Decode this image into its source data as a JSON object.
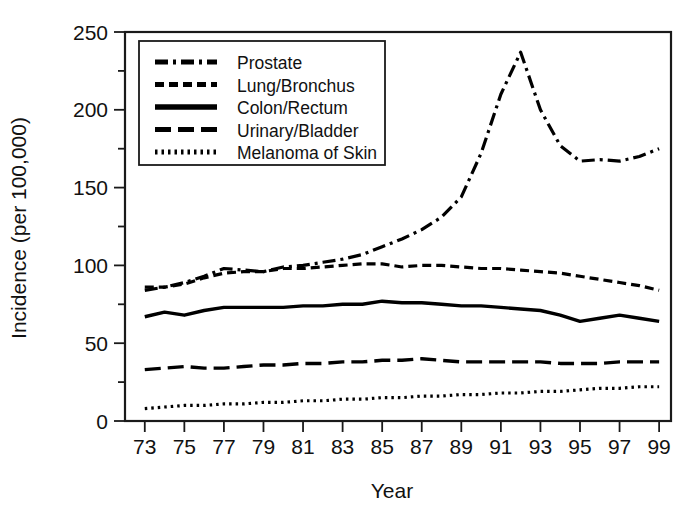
{
  "chart_data": {
    "type": "line",
    "title": "",
    "xlabel": "Year",
    "ylabel": "Incidence (per 100,000)",
    "xlim": [
      72,
      99.6
    ],
    "ylim": [
      0,
      250
    ],
    "grid": false,
    "legend_position": "top-left inside",
    "x_tick_labels": [
      "73",
      "75",
      "77",
      "79",
      "81",
      "83",
      "85",
      "87",
      "89",
      "91",
      "93",
      "95",
      "97",
      "99"
    ],
    "x_tick_values": [
      73,
      75,
      77,
      79,
      81,
      83,
      85,
      87,
      89,
      91,
      93,
      95,
      97,
      99
    ],
    "y_tick_labels": [
      "0",
      "50",
      "100",
      "150",
      "200",
      "250"
    ],
    "y_tick_values": [
      0,
      50,
      100,
      150,
      200,
      250
    ],
    "y_minor_tick_values": [
      25,
      75,
      125,
      175,
      225
    ],
    "x": [
      73,
      74,
      75,
      76,
      77,
      78,
      79,
      80,
      81,
      82,
      83,
      84,
      85,
      86,
      87,
      88,
      89,
      90,
      91,
      92,
      93,
      94,
      95,
      96,
      97,
      98,
      99
    ],
    "series": [
      {
        "name": "Prostate",
        "dash_style": "dash-dot",
        "stroke_width": 3.2,
        "dasharray": "13,5,3,5",
        "values": [
          84,
          86,
          89,
          93,
          98,
          97,
          96,
          99,
          100,
          102,
          104,
          107,
          112,
          117,
          123,
          131,
          144,
          172,
          210,
          237,
          200,
          177,
          167,
          168,
          167,
          170,
          175
        ]
      },
      {
        "name": "Lung/Bronchus",
        "dash_style": "dashed",
        "stroke_width": 3.2,
        "dasharray": "9,5",
        "values": [
          86,
          86,
          88,
          92,
          95,
          96,
          96,
          98,
          98,
          99,
          100,
          101,
          101,
          99,
          100,
          100,
          99,
          98,
          98,
          97,
          96,
          95,
          93,
          91,
          89,
          87,
          84
        ]
      },
      {
        "name": "Colon/Rectum",
        "dash_style": "solid",
        "stroke_width": 3.4,
        "dasharray": "none",
        "values": [
          67,
          70,
          68,
          71,
          73,
          73,
          73,
          73,
          74,
          74,
          75,
          75,
          77,
          76,
          76,
          75,
          74,
          74,
          73,
          72,
          71,
          68,
          64,
          66,
          68,
          66,
          64
        ]
      },
      {
        "name": "Urinary/Bladder",
        "dash_style": "long-dash",
        "stroke_width": 3.4,
        "dasharray": "16,7",
        "values": [
          33,
          34,
          35,
          34,
          34,
          35,
          36,
          36,
          37,
          37,
          38,
          38,
          39,
          39,
          40,
          39,
          38,
          38,
          38,
          38,
          38,
          37,
          37,
          37,
          38,
          38,
          38
        ]
      },
      {
        "name": "Melanoma of Skin",
        "dash_style": "dotted",
        "stroke_width": 3.2,
        "dasharray": "2.5,4",
        "values": [
          8,
          9,
          10,
          10,
          11,
          11,
          12,
          12,
          13,
          13,
          14,
          14,
          15,
          15,
          16,
          16,
          17,
          17,
          18,
          18,
          19,
          19,
          20,
          21,
          21,
          22,
          22
        ]
      }
    ]
  },
  "legend": {
    "entries": [
      {
        "label": "Prostate"
      },
      {
        "label": "Lung/Bronchus"
      },
      {
        "label": "Colon/Rectum"
      },
      {
        "label": "Urinary/Bladder"
      },
      {
        "label": "Melanoma of Skin"
      }
    ]
  },
  "colors": {
    "ink": "#000000",
    "axis": "#1a1a1a",
    "background": "#ffffff"
  }
}
